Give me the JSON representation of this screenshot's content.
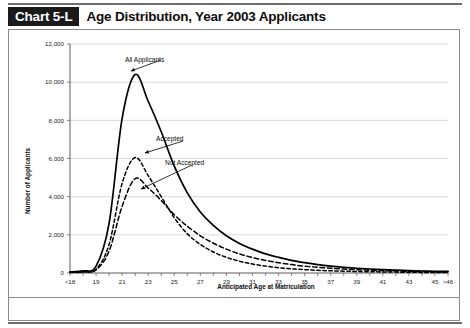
{
  "header": {
    "chart_tag": "Chart 5-L",
    "title": "Age Distribution, Year 2003 Applicants"
  },
  "footer": {
    "source": "Source: AAMC Data Warehouse: Applicant Matriculant File",
    "as_of": "As of November 6, 2003"
  },
  "chart_data": {
    "type": "line",
    "title": "Age Distribution, Year 2003 Applicants",
    "xlabel": "Anticipated Age at Matriculation",
    "ylabel": "Number of Applicants",
    "ylim": [
      0,
      12000
    ],
    "yticks": [
      0,
      2000,
      4000,
      6000,
      8000,
      10000,
      12000
    ],
    "ytick_labels": [
      "0",
      "2,000",
      "4,000",
      "6,000",
      "8,000",
      "10,000",
      "12,000"
    ],
    "grid": true,
    "legend": "annotations",
    "categories": [
      "<18",
      "18",
      "19",
      "20",
      "21",
      "22",
      "23",
      "24",
      "25",
      "26",
      "27",
      "28",
      "29",
      "30",
      "31",
      "32",
      "33",
      "34",
      "35",
      "36",
      "37",
      "38",
      "39",
      "40",
      "41",
      "42",
      "43",
      "44",
      "45",
      ">46"
    ],
    "xtick_labels": [
      "<18",
      "",
      "19",
      "",
      "21",
      "",
      "23",
      "",
      "25",
      "",
      "27",
      "",
      "29",
      "",
      "31",
      "",
      "33",
      "",
      "35",
      "",
      "37",
      "",
      "39",
      "",
      "41",
      "",
      "43",
      "",
      "45",
      ">46"
    ],
    "series": [
      {
        "name": "All Applicants",
        "style": "solid",
        "values": [
          60,
          110,
          360,
          2600,
          8100,
          10400,
          9000,
          7400,
          5600,
          4200,
          3200,
          2500,
          1950,
          1550,
          1250,
          1000,
          820,
          660,
          540,
          440,
          360,
          300,
          250,
          210,
          175,
          150,
          125,
          105,
          90,
          80
        ]
      },
      {
        "name": "Accepted",
        "style": "dashed",
        "values": [
          25,
          55,
          200,
          1500,
          4700,
          6050,
          5100,
          4000,
          2900,
          2050,
          1500,
          1100,
          820,
          620,
          470,
          360,
          280,
          220,
          175,
          140,
          115,
          95,
          78,
          65,
          55,
          46,
          38,
          32,
          27,
          24
        ]
      },
      {
        "name": "Not Accepted",
        "style": "dashed",
        "values": [
          35,
          58,
          165,
          1150,
          3500,
          4950,
          4450,
          3800,
          3050,
          2450,
          1950,
          1560,
          1250,
          1000,
          810,
          660,
          540,
          440,
          360,
          300,
          248,
          205,
          172,
          145,
          122,
          104,
          88,
          74,
          63,
          56
        ]
      }
    ],
    "annotations": [
      {
        "text": "All Applicants",
        "series": "All Applicants"
      },
      {
        "text": "Accepted",
        "series": "Accepted"
      },
      {
        "text": "Not Accepted",
        "series": "Not Accepted"
      }
    ]
  }
}
